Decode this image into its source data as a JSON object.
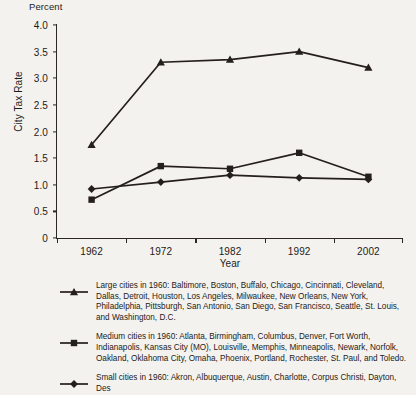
{
  "chart_data": {
    "type": "line",
    "title": "",
    "unit_label": "Percent",
    "xlabel": "Year",
    "ylabel": "City Tax Rate",
    "categories": [
      "1962",
      "1972",
      "1982",
      "1992",
      "2002"
    ],
    "x": [
      1962,
      1972,
      1982,
      1992,
      2002
    ],
    "ylim": [
      0,
      4.0
    ],
    "yticks": [
      "0",
      "0.5",
      "1.0",
      "1.5",
      "2.0",
      "2.5",
      "3.0",
      "3.5",
      "4.0"
    ],
    "ytick_values": [
      0,
      0.5,
      1.0,
      1.5,
      2.0,
      2.5,
      3.0,
      3.5,
      4.0
    ],
    "grid": false,
    "legend_position": "below",
    "series": [
      {
        "name": "Large cities",
        "marker": "triangle",
        "color": "#241f1c",
        "values": [
          1.75,
          3.3,
          3.35,
          3.5,
          3.2
        ]
      },
      {
        "name": "Medium cities",
        "marker": "square",
        "color": "#241f1c",
        "values": [
          0.72,
          1.35,
          1.3,
          1.6,
          1.15
        ]
      },
      {
        "name": "Small cities",
        "marker": "diamond",
        "color": "#241f1c",
        "values": [
          0.92,
          1.05,
          1.18,
          1.13,
          1.1
        ]
      }
    ]
  },
  "legend": {
    "entries": [
      {
        "marker": "triangle",
        "text": "Large cities in 1960: Baltimore, Boston, Buffalo, Chicago, Cincinnati, Cleveland, Dallas, Detroit, Houston, Los Angeles, Milwaukee, New Orleans, New York, Philadelphia, Pittsburgh, San Antonio, San Diego, San Francisco, Seattle, St. Louis, and Washington, D.C."
      },
      {
        "marker": "square",
        "text": "Medium cities in 1960: Atlanta, Birmingham, Columbus, Denver, Fort Worth, Indianapolis, Kansas City (MO), Louisville, Memphis, Minneapolis, Newark, Norfolk, Oakland, Oklahoma City, Omaha, Phoenix, Portland, Rochester, St. Paul, and Toledo."
      },
      {
        "marker": "diamond",
        "text": "Small cities in 1960: Akron, Albuquerque, Austin, Charlotte, Corpus Christi, Dayton, Des"
      }
    ]
  }
}
